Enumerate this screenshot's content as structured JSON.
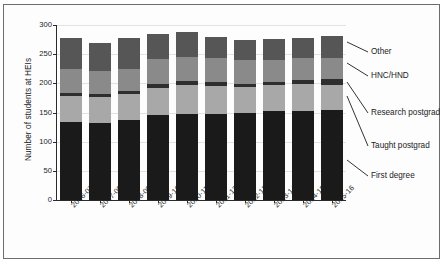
{
  "chart_data": {
    "type": "bar",
    "subtype": "stacked-vertical",
    "title": "",
    "xlabel": "",
    "ylabel": "Number of students at HEIs",
    "ylim": [
      0,
      300
    ],
    "yticks": [
      0,
      50,
      100,
      150,
      200,
      250,
      300
    ],
    "grid": true,
    "grid_axis": "y",
    "legend_position": "right-callout",
    "categories": [
      "2006-07",
      "2007-08",
      "2008-09",
      "2009-10",
      "2010-11",
      "2011-12",
      "2012-13",
      "2013-14",
      "2014-15",
      "2015-16"
    ],
    "series": [
      {
        "name": "First degree",
        "color": "#1a1a1a",
        "values": [
          133,
          132,
          137,
          146,
          148,
          148,
          149,
          152,
          153,
          155
        ]
      },
      {
        "name": "Taught postgrad",
        "color": "#a8a8a8",
        "values": [
          45,
          44,
          44,
          46,
          49,
          47,
          44,
          45,
          46,
          43
        ]
      },
      {
        "name": "Research postgrad",
        "color": "#2e2e2e",
        "values": [
          6,
          6,
          6,
          7,
          7,
          7,
          6,
          5,
          7,
          9
        ]
      },
      {
        "name": "HNC/HND",
        "color": "#8a8a8a",
        "values": [
          40,
          40,
          37,
          43,
          41,
          41,
          41,
          38,
          38,
          36
        ]
      },
      {
        "name": "Other",
        "color": "#565656",
        "values": [
          54,
          48,
          53,
          43,
          43,
          36,
          34,
          36,
          33,
          38
        ]
      }
    ],
    "totals": [
      278,
      270,
      277,
      285,
      288,
      279,
      274,
      276,
      277,
      281
    ],
    "cumulative": [
      [
        133,
        178,
        184,
        224,
        278
      ],
      [
        132,
        176,
        182,
        222,
        270
      ],
      [
        137,
        181,
        187,
        224,
        277
      ],
      [
        146,
        192,
        199,
        242,
        285
      ],
      [
        148,
        197,
        204,
        245,
        288
      ],
      [
        148,
        195,
        202,
        243,
        279
      ],
      [
        149,
        193,
        199,
        240,
        274
      ],
      [
        152,
        197,
        202,
        240,
        276
      ],
      [
        153,
        199,
        206,
        244,
        277
      ],
      [
        155,
        198,
        207,
        243,
        281
      ]
    ]
  },
  "legend": {
    "items": [
      {
        "label": "Other"
      },
      {
        "label": "HNC/HND"
      },
      {
        "label": "Research postgrad"
      },
      {
        "label": "Taught postgrad"
      },
      {
        "label": "First degree"
      }
    ]
  }
}
